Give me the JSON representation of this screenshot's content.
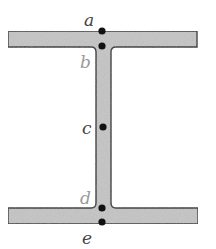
{
  "diagram": {
    "colors": {
      "fill": "#c4c4c4",
      "outline": "#333333",
      "dot": "#111111",
      "label_dark": "#444444",
      "label_light": "#9a9a9a"
    },
    "shape": {
      "top_flange": {
        "x": 8,
        "y": 31,
        "width": 189,
        "height": 16
      },
      "web": {
        "x": 96,
        "y": 47,
        "width": 15,
        "height": 161
      },
      "bottom_flange": {
        "x": 8,
        "y": 208,
        "width": 190,
        "height": 16
      },
      "fillet_radius": 5
    },
    "points": [
      {
        "id": "a",
        "label": "a",
        "x": 102,
        "y": 31,
        "label_x": 84,
        "label_y": 26,
        "label_tone": "dark",
        "location": "top surface of top flange"
      },
      {
        "id": "b",
        "label": "b",
        "x": 102,
        "y": 46,
        "label_x": 80,
        "label_y": 68,
        "label_tone": "light",
        "location": "flange-web junction (top)"
      },
      {
        "id": "c",
        "label": "c",
        "x": 103,
        "y": 127,
        "label_x": 82,
        "label_y": 134,
        "label_tone": "dark",
        "location": "mid-height of web"
      },
      {
        "id": "d",
        "label": "d",
        "x": 102,
        "y": 208,
        "label_x": 80,
        "label_y": 204,
        "label_tone": "light",
        "location": "flange-web junction (bottom)"
      },
      {
        "id": "e",
        "label": "e",
        "x": 102,
        "y": 222,
        "label_x": 82,
        "label_y": 244,
        "label_tone": "dark",
        "location": "bottom surface of bottom flange"
      }
    ]
  }
}
